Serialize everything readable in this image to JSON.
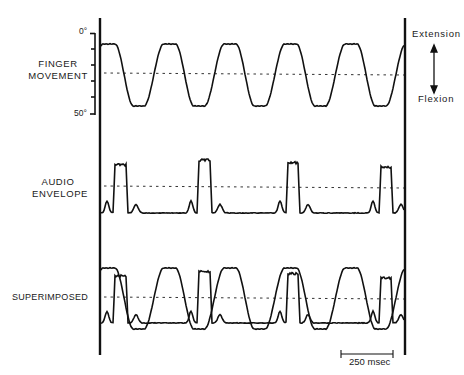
{
  "chart_data": {
    "type": "line",
    "title": "",
    "panels": [
      {
        "name": "FINGER MOVEMENT",
        "label_lines": [
          "FINGER",
          "MOVEMENT"
        ],
        "y_axis": {
          "top_label": "0°",
          "bottom_label": "50°",
          "range_deg": [
            0,
            50
          ]
        },
        "description": "Periodic finger flexion/extension, ~4 cycles per 250 msec scale length ratio; plateaus at extension, troughs at flexion",
        "series": [
          {
            "name": "finger",
            "period_ms": 280,
            "extension_level": 0.0,
            "flexion_level": 1.0
          }
        ]
      },
      {
        "name": "AUDIO ENVELOPE",
        "label_lines": [
          "AUDIO",
          "ENVELOPE"
        ],
        "description": "Square-ish audio bursts coinciding with finger extension phases, small bumps between",
        "series": [
          {
            "name": "audio",
            "bursts": 4
          }
        ]
      },
      {
        "name": "SUPERIMPOSED",
        "label_lines": [
          "SUPERIMPOSED"
        ],
        "description": "Finger movement and audio envelope overlaid",
        "series": [
          {
            "name": "finger"
          },
          {
            "name": "audio"
          }
        ]
      }
    ],
    "right_annotation": {
      "top": "Extension",
      "bottom": "Flexion"
    },
    "scale_bar": "250 msec",
    "grid": false
  },
  "labels": {
    "finger_1": "FINGER",
    "finger_2": "MOVEMENT",
    "audio_1": "AUDIO",
    "audio_2": "ENVELOPE",
    "super": "SUPERIMPOSED",
    "deg0": "0°",
    "deg50": "50°",
    "extension": "Extension",
    "flexion": "Flexion",
    "scale": "250 msec"
  }
}
